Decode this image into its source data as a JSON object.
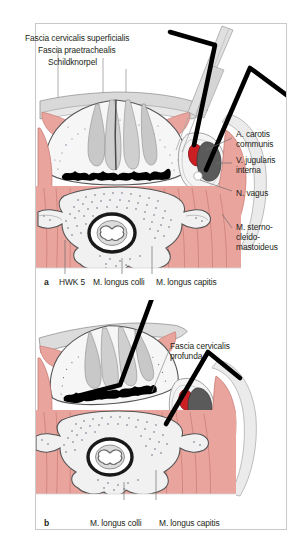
{
  "figure": {
    "kind": "anatomical-cross-section-illustration",
    "region": "cervical spine / neck transverse section",
    "panels": [
      {
        "id": "a",
        "panel_label": "a",
        "vertebra_level": "HWK 5",
        "labels_top_left": [
          "Fascia cervicalis superficialis",
          "Fascia praetrachealis",
          "Schildknorpel"
        ],
        "labels_right": [
          "A. carotis\ncommunis",
          "V. jugularis\ninterna",
          "N. vagus",
          "M. sterno-\ncleido-\nmastoideus"
        ],
        "labels_bottom": [
          "HWK 5",
          "M. longus colli",
          "M. longus capitis"
        ]
      },
      {
        "id": "b",
        "panel_label": "b",
        "labels_right": [
          "Fascia cervicalis\nprofunda"
        ],
        "labels_bottom": [
          "M. longus colli",
          "M. longus capitis"
        ]
      }
    ]
  },
  "text": {
    "a_fascia_superficialis": "Fascia cervicalis superficialis",
    "a_fascia_praetrachealis": "Fascia praetrachealis",
    "a_schildknorpel": "Schildknorpel",
    "a_carotis_l1": "A. carotis",
    "a_carotis_l2": "communis",
    "a_jugularis_l1": "V. jugularis",
    "a_jugularis_l2": "interna",
    "a_vagus": "N. vagus",
    "a_scm_l1": "M. sterno-",
    "a_scm_l2": "cleido-",
    "a_scm_l3": "mastoideus",
    "a_panel": "a",
    "a_hwk5": "HWK 5",
    "a_longus_colli": "M. longus colli",
    "a_longus_capitis": "M. longus capitis",
    "b_fascia_profunda_l1": "Fascia cervicalis",
    "b_fascia_profunda_l2": "profunda",
    "b_panel": "b",
    "b_longus_colli": "M. longus colli",
    "b_longus_capitis": "M. longus capitis"
  },
  "colors": {
    "frame_border": "#c9c9c9",
    "page_bg": "#ffffff",
    "text": "#231f20",
    "muscle_fill": "#e9a49d",
    "muscle_stroke": "#c2736c",
    "fascia_fill": "#d9d9d9",
    "fascia_stroke": "#8a8a8a",
    "bone_fill": "#f2f2f2",
    "bone_stroke": "#6e6e6e",
    "cartilage_fill": "#d2d2d2",
    "artery_fill": "#cc1f24",
    "vein_fill": "#5a5a5a",
    "instrument_fill": "#d8d8d8",
    "retractor_black": "#000000",
    "leader_line": "#8c8c8c"
  }
}
